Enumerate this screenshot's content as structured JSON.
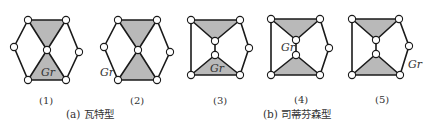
{
  "figure": {
    "ground_label": "Gr",
    "diagrams": [
      {
        "id": "1",
        "label": "(1)"
      },
      {
        "id": "2",
        "label": "(2)"
      },
      {
        "id": "3",
        "label": "(3)"
      },
      {
        "id": "4",
        "label": "(4)"
      },
      {
        "id": "5",
        "label": "(5)"
      }
    ],
    "captions": {
      "a": "(a) 瓦特型",
      "b": "(b) 司蒂芬森型"
    }
  },
  "colors": {
    "link": "#1a1a1a",
    "triangle_fill": "#b9b9b9",
    "joint_fill": "#ffffff"
  }
}
